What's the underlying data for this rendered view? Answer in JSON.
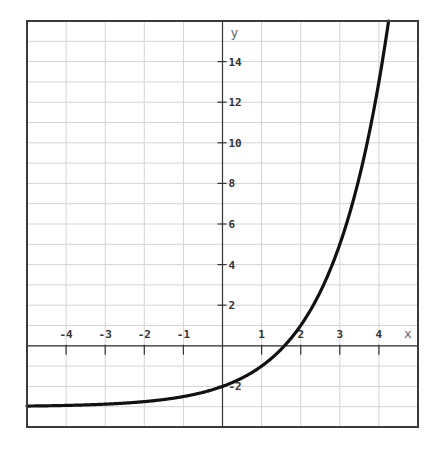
{
  "chart_data": {
    "type": "line",
    "title": "",
    "xlabel": "x",
    "ylabel": "y",
    "function": "y = 2^x - 3",
    "xlim": [
      -5,
      5
    ],
    "ylim": [
      -4,
      16
    ],
    "grid": true,
    "grid_step": {
      "x": 1,
      "y": 1
    },
    "x_ticks": [
      -4,
      -3,
      -2,
      -1,
      1,
      2,
      3,
      4
    ],
    "x_tick_labels": [
      "-4",
      "-3",
      "-2",
      "-1",
      "1",
      "2",
      "3",
      "4"
    ],
    "y_ticks": [
      -2,
      2,
      4,
      6,
      8,
      10,
      12,
      14
    ],
    "y_tick_labels": [
      "-2",
      "2",
      "4",
      "6",
      "8",
      "10",
      "12",
      "14"
    ],
    "series": [
      {
        "name": "y = 2^x - 3",
        "color": "#111111",
        "x": [
          -5,
          -4,
          -3,
          -2,
          -1,
          0,
          1,
          1.585,
          2,
          2.5,
          3,
          3.5,
          4,
          4.09
        ],
        "y": [
          -2.97,
          -2.94,
          -2.88,
          -2.75,
          -2.5,
          -2,
          -1,
          0,
          1,
          2.66,
          5,
          8.31,
          13,
          14.03
        ]
      }
    ],
    "annotations": [
      {
        "text": "x-intercept near x ≈ 1.58"
      },
      {
        "text": "y-intercept at y = -2"
      },
      {
        "text": "horizontal asymptote y = -3"
      }
    ]
  },
  "colors": {
    "grid": "#d4d4d4",
    "axis": "#333333",
    "frame": "#3a3a3a",
    "curve": "#111111"
  }
}
